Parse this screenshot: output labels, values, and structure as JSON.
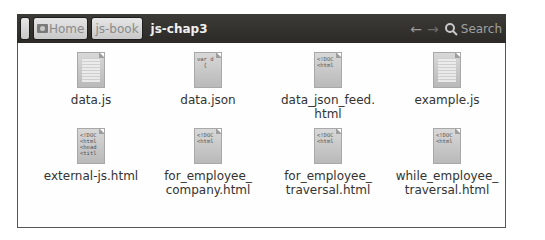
{
  "toolbar": {
    "breadcrumbs": [
      {
        "label": ""
      },
      {
        "label": "Home",
        "icon": "home-icon"
      },
      {
        "label": "js-book"
      }
    ],
    "current": "js-chap3",
    "back_icon": "←",
    "forward_icon": "→",
    "search_label": "Search"
  },
  "files": [
    {
      "name": "data.js",
      "icon_type": "js",
      "preview": ""
    },
    {
      "name": "data.json",
      "icon_type": "text",
      "preview": "var d\n  {"
    },
    {
      "name": "data_json_feed.\nhtml",
      "icon_type": "html",
      "preview": "<!DOC\n<html"
    },
    {
      "name": "example.js",
      "icon_type": "js",
      "preview": ""
    },
    {
      "name": "external-js.html",
      "icon_type": "html",
      "preview": "<!DOC\n<html\n<head\n<titl"
    },
    {
      "name": "for_employee_\ncompany.html",
      "icon_type": "html",
      "preview": "<!DOC\n<html"
    },
    {
      "name": "for_employee_\ntraversal.html",
      "icon_type": "html",
      "preview": "<!DOC\n<html"
    },
    {
      "name": "while_employee_\ntraversal.html",
      "icon_type": "html",
      "preview": "<!DOC\n<html"
    }
  ]
}
